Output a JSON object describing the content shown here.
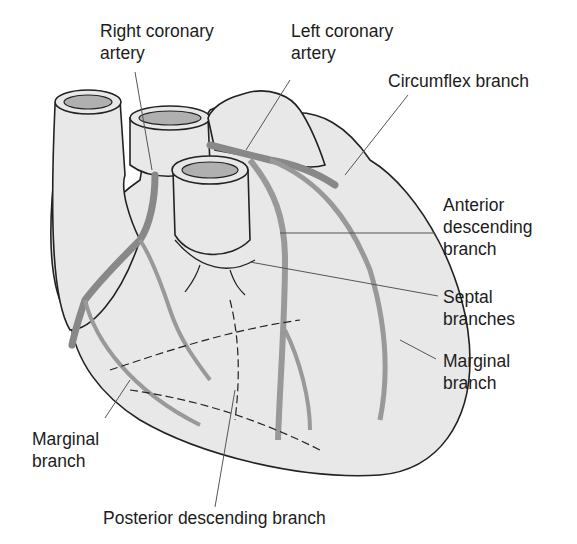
{
  "diagram": {
    "colors": {
      "heart_fill": "#e8e8e8",
      "artery_fill": "#a9a9a9",
      "outline": "#222222",
      "leader_line": "#555555",
      "background": "#ffffff"
    },
    "labels": [
      {
        "id": "right-coronary-artery",
        "lines": [
          "Right coronary",
          "artery"
        ]
      },
      {
        "id": "left-coronary-artery",
        "lines": [
          "Left coronary",
          "artery"
        ]
      },
      {
        "id": "circumflex-branch",
        "lines": [
          "Circumflex branch"
        ]
      },
      {
        "id": "anterior-descending-branch",
        "lines": [
          "Anterior",
          "descending",
          "branch"
        ]
      },
      {
        "id": "septal-branches",
        "lines": [
          "Septal",
          "branches"
        ]
      },
      {
        "id": "marginal-branch-right",
        "lines": [
          "Marginal",
          "branch"
        ]
      },
      {
        "id": "marginal-branch-left",
        "lines": [
          "Marginal",
          "branch"
        ]
      },
      {
        "id": "posterior-descending-branch",
        "lines": [
          "Posterior descending branch"
        ]
      }
    ]
  }
}
